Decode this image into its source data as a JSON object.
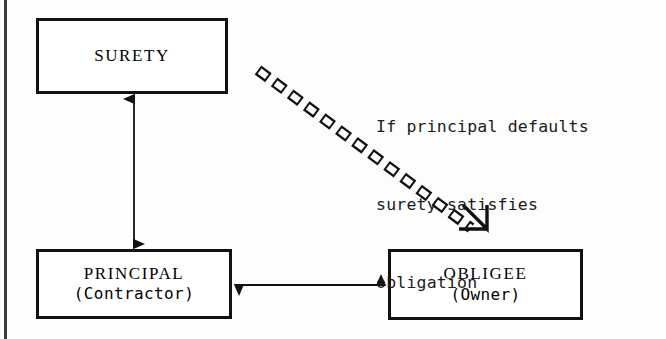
{
  "diagram": {
    "colors": {
      "ink": "#111111",
      "paper": "#fdfdfd",
      "page_edge": "#2a2a2a"
    },
    "boxes": [
      {
        "id": "surety",
        "title": "SURETY",
        "subtitle": ""
      },
      {
        "id": "principal",
        "title": "PRINCIPAL",
        "subtitle": "(Contractor)"
      },
      {
        "id": "obligee",
        "title": "OBLIGEE",
        "subtitle": "(Owner)"
      }
    ],
    "connectors": [
      {
        "id": "surety-principal",
        "style": "solid",
        "heads": "both",
        "from": "principal",
        "to": "surety"
      },
      {
        "id": "principal-obligee",
        "style": "solid",
        "heads": "both",
        "from": "principal",
        "to": "obligee"
      },
      {
        "id": "surety-obligee-dashed",
        "style": "dashed-outline",
        "heads": "end-open",
        "from": "surety",
        "to": "obligee"
      }
    ],
    "annotation": {
      "line1": "If principal defaults",
      "line2": "surety satisfies",
      "line3": "obligation"
    }
  }
}
